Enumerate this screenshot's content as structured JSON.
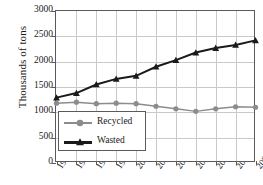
{
  "chart_data": {
    "type": "line",
    "title": "",
    "xlabel": "",
    "ylabel": "Thousands of tons",
    "ylim": [
      0,
      3000
    ],
    "ytick_values": [
      3000,
      2500,
      2000,
      1500,
      1000,
      500,
      0
    ],
    "ytick_labels": [
      "3000",
      "2500",
      "2000",
      "1500",
      "1000",
      "500",
      "0"
    ],
    "grid": true,
    "legend_position": "lower-left-inside",
    "categories": [
      "1996",
      "1997",
      "1998",
      "1999",
      "2000",
      "2001",
      "2002",
      "2003",
      "2004",
      "2005e",
      "2006e"
    ],
    "series": [
      {
        "name": "Recycled",
        "color": "#8c8c8c",
        "marker": "circle",
        "values": [
          1180,
          1200,
          1170,
          1180,
          1170,
          1120,
          1070,
          1020,
          1070,
          1110,
          1100
        ]
      },
      {
        "name": "Wasted",
        "color": "#1a1a1a",
        "marker": "triangle",
        "values": [
          1290,
          1380,
          1550,
          1660,
          1720,
          1900,
          2030,
          2180,
          2270,
          2330,
          2420
        ]
      }
    ]
  },
  "legend": {
    "entries": [
      {
        "label": "Recycled"
      },
      {
        "label": "Wasted"
      }
    ]
  }
}
